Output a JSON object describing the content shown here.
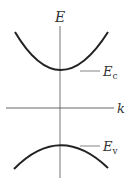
{
  "diagram": {
    "type": "band-structure",
    "axes": {
      "y_label": "E",
      "x_label": "k"
    },
    "bands": [
      {
        "name": "conduction-band",
        "label_main": "E",
        "label_sub": "c"
      },
      {
        "name": "valence-band",
        "label_main": "E",
        "label_sub": "v"
      }
    ],
    "colors": {
      "curve": "#222222",
      "axis": "#555555",
      "text": "#333333"
    }
  }
}
